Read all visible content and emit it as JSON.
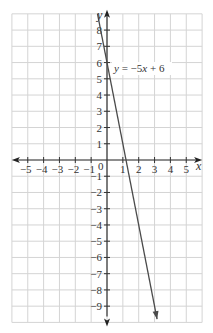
{
  "chart_data": {
    "type": "line",
    "title": "",
    "xlabel": "x",
    "ylabel": "y",
    "xlim": [
      -6,
      6
    ],
    "ylim": [
      -10,
      9
    ],
    "grid": true,
    "x_ticks": [
      -5,
      -4,
      -3,
      -2,
      -1,
      0,
      1,
      2,
      3,
      4,
      5
    ],
    "y_ticks": [
      8,
      7,
      6,
      5,
      4,
      3,
      2,
      1,
      -1,
      -2,
      -3,
      -4,
      -5,
      -6,
      -7,
      -8,
      -9
    ],
    "x_tick_labels": [
      "−5",
      "−4",
      "−3",
      "−2",
      "−1",
      "1",
      "2",
      "3",
      "4",
      "5"
    ],
    "y_tick_labels": [
      "8",
      "7",
      "6",
      "5",
      "4",
      "3",
      "2",
      "1",
      "−1",
      "−2",
      "−3",
      "−4",
      "−5",
      "−6",
      "−7",
      "−8",
      "−9"
    ],
    "origin_label": "0",
    "series": [
      {
        "name": "y = −5x + 6",
        "equation": "y = -5x + 6",
        "slope": -5,
        "intercept": 6,
        "x": [
          -0.6,
          3.16
        ],
        "y": [
          9,
          -9.8
        ],
        "color": "#4a4a4a"
      }
    ],
    "annotations": [
      {
        "text_parts": [
          "y",
          " = −5",
          "x",
          " + 6"
        ],
        "position": [
          0.5,
          6
        ]
      }
    ]
  }
}
